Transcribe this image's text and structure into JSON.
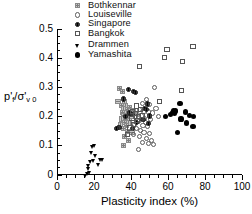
{
  "chart_data": {
    "type": "scatter",
    "title": "",
    "xlabel": "Plasticity index (%)",
    "ylabel": "p'f/sigma'v0",
    "ylabel_parts": {
      "numerator": "p",
      "numerator_prime": "'",
      "numerator_sub": "f",
      "denominator": "σ",
      "denominator_prime": "'",
      "denominator_sub": "v 0",
      "separator": "/"
    },
    "xlim": [
      0,
      100
    ],
    "ylim": [
      0,
      0.5
    ],
    "xticks": [
      0,
      20,
      40,
      60,
      80,
      100
    ],
    "xtick_labels": [
      "0",
      "20",
      "40",
      "60",
      "80",
      "100"
    ],
    "xticks_minor": [
      5,
      10,
      15,
      25,
      30,
      35,
      45,
      50,
      55,
      65,
      70,
      75,
      85,
      90,
      95
    ],
    "yticks": [
      0,
      0.1,
      0.2,
      0.3,
      0.4,
      0.5
    ],
    "ytick_labels": [
      "0",
      "0.1",
      "0.2",
      "0.3",
      "0.4",
      "0.5"
    ],
    "yticks_minor": [
      0.025,
      0.05,
      0.075,
      0.125,
      0.15,
      0.175,
      0.225,
      0.25,
      0.275,
      0.325,
      0.35,
      0.375,
      0.425,
      0.45,
      0.475
    ],
    "grid": false,
    "legend_position": "top-center",
    "series": [
      {
        "name": "Bothkennar",
        "marker": "hatched-square",
        "color": "#c9c9c9",
        "points": [
          [
            34.0,
            0.295
          ],
          [
            35.5,
            0.287
          ],
          [
            33.0,
            0.252
          ],
          [
            36.5,
            0.25
          ],
          [
            35.0,
            0.238
          ],
          [
            37.0,
            0.236
          ],
          [
            39.0,
            0.232
          ],
          [
            36.0,
            0.226
          ],
          [
            38.0,
            0.224
          ],
          [
            40.0,
            0.222
          ],
          [
            41.5,
            0.22
          ],
          [
            35.5,
            0.214
          ],
          [
            37.5,
            0.212
          ],
          [
            39.5,
            0.21
          ],
          [
            41.0,
            0.209
          ],
          [
            36.0,
            0.203
          ],
          [
            38.0,
            0.201
          ],
          [
            40.0,
            0.199
          ],
          [
            35.0,
            0.192
          ],
          [
            37.0,
            0.19
          ],
          [
            39.0,
            0.188
          ],
          [
            36.5,
            0.18
          ],
          [
            38.5,
            0.178
          ],
          [
            34.5,
            0.171
          ],
          [
            37.5,
            0.169
          ],
          [
            36.0,
            0.158
          ],
          [
            38.0,
            0.148
          ],
          [
            40.5,
            0.146
          ],
          [
            36.5,
            0.132
          ],
          [
            38.5,
            0.118
          ],
          [
            36.0,
            0.101
          ]
        ]
      },
      {
        "name": "Louiseville",
        "marker": "open-circle",
        "color": "#5a5a5a",
        "points": [
          [
            52.5,
            0.299
          ],
          [
            48.5,
            0.259
          ],
          [
            46.0,
            0.244
          ],
          [
            50.0,
            0.241
          ],
          [
            53.5,
            0.228
          ],
          [
            44.5,
            0.224
          ],
          [
            47.0,
            0.219
          ],
          [
            49.5,
            0.216
          ],
          [
            51.5,
            0.212
          ],
          [
            43.5,
            0.206
          ],
          [
            45.5,
            0.202
          ],
          [
            55.0,
            0.2
          ],
          [
            42.5,
            0.196
          ],
          [
            47.5,
            0.193
          ],
          [
            50.5,
            0.19
          ],
          [
            44.0,
            0.184
          ],
          [
            48.0,
            0.18
          ],
          [
            42.0,
            0.174
          ],
          [
            46.5,
            0.17
          ],
          [
            49.0,
            0.166
          ],
          [
            43.0,
            0.16
          ],
          [
            45.0,
            0.152
          ],
          [
            47.0,
            0.146
          ],
          [
            50.0,
            0.143
          ],
          [
            41.5,
            0.139
          ],
          [
            44.5,
            0.131
          ],
          [
            48.5,
            0.124
          ],
          [
            51.0,
            0.117
          ],
          [
            46.0,
            0.112
          ],
          [
            49.5,
            0.108
          ],
          [
            52.0,
            0.104
          ],
          [
            44.0,
            0.086
          ]
        ]
      },
      {
        "name": "Singapore",
        "marker": "filled-speckled-circle",
        "color": "#3a3a3a",
        "points": [
          [
            38.5,
            0.294
          ],
          [
            41.5,
            0.287
          ],
          [
            42.5,
            0.283
          ],
          [
            36.0,
            0.26
          ],
          [
            49.0,
            0.243
          ],
          [
            47.5,
            0.229
          ],
          [
            48.5,
            0.225
          ],
          [
            39.0,
            0.212
          ],
          [
            40.5,
            0.208
          ],
          [
            50.0,
            0.202
          ],
          [
            37.0,
            0.199
          ],
          [
            46.5,
            0.19
          ],
          [
            49.5,
            0.176
          ],
          [
            43.0,
            0.181
          ],
          [
            33.5,
            0.163
          ],
          [
            32.0,
            0.158
          ],
          [
            41.0,
            0.158
          ]
        ]
      },
      {
        "name": "Bangkok",
        "marker": "open-square",
        "color": "#555555",
        "points": [
          [
            73.5,
            0.44
          ],
          [
            59.5,
            0.431
          ],
          [
            68.0,
            0.388
          ],
          [
            58.0,
            0.403
          ],
          [
            44.5,
            0.372
          ],
          [
            67.5,
            0.289
          ],
          [
            55.5,
            0.253
          ],
          [
            43.0,
            0.236
          ],
          [
            45.0,
            0.223
          ],
          [
            41.0,
            0.218
          ],
          [
            42.5,
            0.21
          ],
          [
            46.0,
            0.205
          ],
          [
            44.0,
            0.199
          ],
          [
            40.5,
            0.194
          ],
          [
            43.5,
            0.188
          ],
          [
            41.5,
            0.172
          ],
          [
            39.5,
            0.161
          ],
          [
            38.0,
            0.139
          ]
        ]
      },
      {
        "name": "Drammen",
        "marker": "filled-triangle-down",
        "color": "#000000",
        "points": [
          [
            20.5,
            0.099
          ],
          [
            19.5,
            0.096
          ],
          [
            19.0,
            0.073
          ],
          [
            21.0,
            0.063
          ],
          [
            23.5,
            0.052
          ],
          [
            25.0,
            0.05
          ],
          [
            20.0,
            0.047
          ],
          [
            18.5,
            0.044
          ],
          [
            22.5,
            0.034
          ],
          [
            17.5,
            0.03
          ],
          [
            17.0,
            0.019
          ],
          [
            18.0,
            0.006
          ],
          [
            16.5,
            0.004
          ],
          [
            15.5,
            -0.004
          ]
        ]
      },
      {
        "name": "Yamashita",
        "marker": "filled-circle",
        "color": "#000000",
        "points": [
          [
            66.5,
            0.245
          ],
          [
            63.0,
            0.222
          ],
          [
            64.0,
            0.219
          ],
          [
            62.5,
            0.214
          ],
          [
            63.5,
            0.211
          ],
          [
            61.5,
            0.208
          ],
          [
            69.5,
            0.216
          ],
          [
            71.5,
            0.205
          ],
          [
            74.0,
            0.2
          ],
          [
            67.0,
            0.192
          ],
          [
            70.0,
            0.178
          ],
          [
            73.5,
            0.165
          ],
          [
            65.0,
            0.145
          ],
          [
            58.5,
            0.201
          ]
        ]
      }
    ]
  },
  "legend": {
    "items": [
      {
        "label": "Bothkennar",
        "marker": "hatched-square"
      },
      {
        "label": "Louiseville",
        "marker": "open-circle"
      },
      {
        "label": "Singapore",
        "marker": "filled-speckled-circle"
      },
      {
        "label": "Bangkok",
        "marker": "open-square"
      },
      {
        "label": "Drammen",
        "marker": "filled-triangle-down"
      },
      {
        "label": "Yamashita",
        "marker": "filled-circle"
      }
    ]
  }
}
